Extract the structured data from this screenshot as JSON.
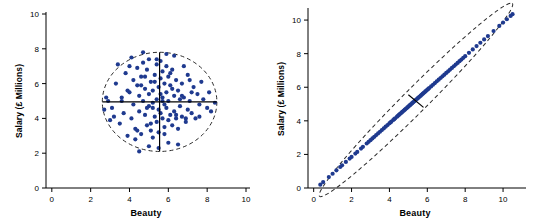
{
  "figure": {
    "background": "#ffffff",
    "point_color": "#1f3a8f",
    "axis_color": "#000000",
    "ellipse_color": "#2b2b2b"
  },
  "chart_data": [
    {
      "type": "scatter",
      "title": "",
      "panel": "left",
      "xlabel": "Beauty",
      "ylabel": "Salary (£ Millions)",
      "xlim": [
        -0.3,
        10
      ],
      "ylim": [
        0,
        10
      ],
      "xticks": [
        0,
        2,
        4,
        6,
        8,
        10
      ],
      "yticks": [
        0,
        2,
        4,
        6,
        8,
        10
      ],
      "grid": false,
      "legend": "none",
      "annotations": [
        {
          "kind": "ellipse",
          "cx": 5.55,
          "cy": 4.95,
          "rx": 2.95,
          "ry": 2.85,
          "rotation": 0,
          "style": "dashed"
        },
        {
          "kind": "line",
          "x1": 2.6,
          "y1": 4.95,
          "x2": 8.5,
          "y2": 4.95,
          "style": "solid"
        },
        {
          "kind": "line",
          "x1": 5.55,
          "y1": 2.1,
          "x2": 5.55,
          "y2": 7.8,
          "style": "solid"
        }
      ],
      "x": [
        3.1,
        3.3,
        3.5,
        3.6,
        3.7,
        3.8,
        3.9,
        4.0,
        4.0,
        4.1,
        4.2,
        4.2,
        4.3,
        4.4,
        4.4,
        4.5,
        4.5,
        4.6,
        4.6,
        4.7,
        4.7,
        4.8,
        4.8,
        4.9,
        4.9,
        5.0,
        5.0,
        5.0,
        5.1,
        5.1,
        5.2,
        5.2,
        5.2,
        5.3,
        5.3,
        5.4,
        5.4,
        5.4,
        5.5,
        5.5,
        5.5,
        5.6,
        5.6,
        5.6,
        5.7,
        5.7,
        5.7,
        5.8,
        5.8,
        5.8,
        5.9,
        5.9,
        5.9,
        6.0,
        6.0,
        6.0,
        6.1,
        6.1,
        6.2,
        6.2,
        6.3,
        6.3,
        6.4,
        6.4,
        6.5,
        6.5,
        6.6,
        6.7,
        6.7,
        6.8,
        6.9,
        7.0,
        7.0,
        7.1,
        7.2,
        7.3,
        7.4,
        7.5,
        7.6,
        7.7,
        7.8,
        8.0,
        8.2,
        8.4,
        2.7,
        2.9,
        3.0,
        3.2,
        3.4,
        4.1,
        4.3,
        4.6,
        4.9,
        5.1,
        5.3,
        5.6,
        5.8,
        6.1,
        6.4,
        6.6,
        6.9,
        7.2,
        4.5,
        5.0,
        5.5,
        6.0,
        6.5,
        3.9,
        4.4,
        4.8,
        5.2,
        5.7,
        6.2,
        6.7,
        7.1,
        7.6,
        5.9,
        6.3,
        4.7,
        5.4,
        6.8,
        3.6,
        8.1,
        2.8
      ],
      "y": [
        4.6,
        6.0,
        3.7,
        5.2,
        4.3,
        6.6,
        3.0,
        5.5,
        7.0,
        4.0,
        6.2,
        4.8,
        3.4,
        5.9,
        6.9,
        4.4,
        5.3,
        3.1,
        6.4,
        5.0,
        7.2,
        4.2,
        5.7,
        3.6,
        6.8,
        4.7,
        5.4,
        7.4,
        3.3,
        6.1,
        4.9,
        5.6,
        2.9,
        4.1,
        6.5,
        3.8,
        5.1,
        7.1,
        4.5,
        5.8,
        3.2,
        4.3,
        6.3,
        7.3,
        4.0,
        5.2,
        6.7,
        3.5,
        4.8,
        6.0,
        4.6,
        5.5,
        7.0,
        3.9,
        5.0,
        6.4,
        4.2,
        5.9,
        3.6,
        6.8,
        4.4,
        5.3,
        4.0,
        6.2,
        3.4,
        5.6,
        4.7,
        4.1,
        6.0,
        5.2,
        3.8,
        4.5,
        6.5,
        5.0,
        4.3,
        5.8,
        4.0,
        5.4,
        4.8,
        6.1,
        5.1,
        4.6,
        4.4,
        4.9,
        4.5,
        5.0,
        3.9,
        4.1,
        7.1,
        7.5,
        2.8,
        5.9,
        4.6,
        3.7,
        6.1,
        5.4,
        3.1,
        6.6,
        4.2,
        5.1,
        4.0,
        5.5,
        2.1,
        2.4,
        2.3,
        2.6,
        2.5,
        5.6,
        3.3,
        6.4,
        4.6,
        5.0,
        5.7,
        5.3,
        6.2,
        4.1,
        7.7,
        7.6,
        7.8,
        7.4,
        7.0,
        5.0,
        5.5,
        5.2
      ]
    },
    {
      "type": "scatter",
      "title": "",
      "panel": "right",
      "xlabel": "Beauty",
      "ylabel": "Salary (£ Millions)",
      "xlim": [
        -0.3,
        11
      ],
      "ylim": [
        0,
        10.6
      ],
      "xticks": [
        0,
        2,
        4,
        6,
        8,
        10
      ],
      "yticks": [
        0,
        2,
        4,
        6,
        8,
        10
      ],
      "grid": false,
      "legend": "none",
      "annotations": [
        {
          "kind": "ellipse",
          "cx": 5.4,
          "cy": 5.25,
          "rx": 7.2,
          "ry": 0.72,
          "rotation": -45,
          "style": "dashed"
        },
        {
          "kind": "line",
          "x1": 0.35,
          "y1": 0.2,
          "x2": 10.5,
          "y2": 10.3,
          "style": "solid",
          "note": "major-axis implied by point cloud"
        },
        {
          "kind": "line",
          "x1": 5.0,
          "y1": 5.55,
          "x2": 5.8,
          "y2": 4.8,
          "style": "solid"
        }
      ],
      "x": [
        0.35,
        0.5,
        0.8,
        1.0,
        1.2,
        1.4,
        1.5,
        1.7,
        1.9,
        2.0,
        2.2,
        2.3,
        2.5,
        2.6,
        2.8,
        2.9,
        3.0,
        3.1,
        3.2,
        3.3,
        3.4,
        3.5,
        3.6,
        3.7,
        3.8,
        3.9,
        4.0,
        4.05,
        4.1,
        4.2,
        4.25,
        4.3,
        4.4,
        4.45,
        4.5,
        4.55,
        4.6,
        4.65,
        4.7,
        4.75,
        4.8,
        4.85,
        4.9,
        4.95,
        5.0,
        5.05,
        5.1,
        5.15,
        5.2,
        5.25,
        5.3,
        5.35,
        5.4,
        5.45,
        5.5,
        5.55,
        5.6,
        5.65,
        5.7,
        5.75,
        5.8,
        5.85,
        5.9,
        5.95,
        6.0,
        6.05,
        6.1,
        6.2,
        6.3,
        6.4,
        6.5,
        6.6,
        6.7,
        6.8,
        6.9,
        7.0,
        7.1,
        7.2,
        7.3,
        7.4,
        7.5,
        7.6,
        7.7,
        7.8,
        7.9,
        8.0,
        8.2,
        8.4,
        8.6,
        8.8,
        9.0,
        9.2,
        9.5,
        9.8,
        10.0,
        10.2,
        10.4,
        10.5
      ],
      "y": [
        0.2,
        0.35,
        0.65,
        0.85,
        1.05,
        1.25,
        1.35,
        1.55,
        1.75,
        1.85,
        2.05,
        2.15,
        2.35,
        2.45,
        2.65,
        2.75,
        2.85,
        2.95,
        3.05,
        3.15,
        3.25,
        3.35,
        3.45,
        3.55,
        3.65,
        3.75,
        3.85,
        3.9,
        3.95,
        4.05,
        4.1,
        4.15,
        4.25,
        4.3,
        4.35,
        4.4,
        4.45,
        4.5,
        4.55,
        4.6,
        4.65,
        4.7,
        4.75,
        4.8,
        4.85,
        4.9,
        4.95,
        5.0,
        5.05,
        5.1,
        5.15,
        5.2,
        5.25,
        5.3,
        5.35,
        5.4,
        5.45,
        5.5,
        5.55,
        5.6,
        5.65,
        5.7,
        5.75,
        5.8,
        5.85,
        5.9,
        5.95,
        6.05,
        6.15,
        6.25,
        6.35,
        6.45,
        6.55,
        6.65,
        6.75,
        6.85,
        6.95,
        7.05,
        7.15,
        7.25,
        7.35,
        7.45,
        7.55,
        7.65,
        7.75,
        7.85,
        8.05,
        8.25,
        8.45,
        8.65,
        8.85,
        9.05,
        9.35,
        9.65,
        9.85,
        10.05,
        10.25,
        10.35
      ]
    }
  ]
}
